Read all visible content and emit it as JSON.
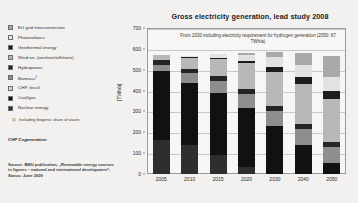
{
  "legend": {
    "items": [
      {
        "label": "EU grid interconnection",
        "color": "#a9a9a9"
      },
      {
        "label": "Photovoltaics",
        "color": "#e2e2e0"
      },
      {
        "label": "Geothermal energy",
        "color": "#1c1c1c"
      },
      {
        "label": "Wind en. (onshore/offshore)",
        "color": "#b8b8b8"
      },
      {
        "label": "Hydropower",
        "color": "#252525"
      },
      {
        "label": "Biomass",
        "sup": "1",
        "color": "#8e8e8e"
      },
      {
        "label": "CHP, fossil",
        "color": "#d2d2d0"
      },
      {
        "label": "Coal/gas",
        "color": "#111111"
      },
      {
        "label": "Nuclear energy",
        "color": "#2e2e2e"
      }
    ]
  },
  "footnote": {
    "mark": "1)",
    "text": "Including biogenic share of waste"
  },
  "chp_note": "CHP Cogeneration",
  "source": "Source: BMU publication, „Renewable energy sources in figures – national and international development“, Status: June 2009",
  "chart_data": {
    "type": "bar",
    "title": "Gross electricity generation, lead study 2008",
    "annotation": "From 2030 including electricity requirement for hydrogen generation (2050: 67 TWh/a)",
    "xlabel": "",
    "ylabel": "[TWh/a]",
    "ylim": [
      0,
      700
    ],
    "yticks": [
      0,
      100,
      200,
      300,
      400,
      500,
      600,
      700
    ],
    "grid": true,
    "legend_position": "left-external",
    "categories": [
      "2005",
      "2010",
      "2015",
      "2020",
      "2030",
      "2040",
      "2050"
    ],
    "series": [
      {
        "name": "Nuclear energy",
        "color": "#2e2e2e",
        "values": [
          163,
          140,
          92,
          33,
          0,
          0,
          0
        ]
      },
      {
        "name": "Coal/gas",
        "color": "#111111",
        "values": [
          330,
          298,
          295,
          283,
          230,
          140,
          52
        ]
      },
      {
        "name": "CHP, fossil",
        "color": "#d2d2d0",
        "values": [
          0,
          0,
          0,
          0,
          0,
          0,
          0
        ]
      },
      {
        "name": "Biomass",
        "color": "#8e8e8e",
        "values": [
          30,
          45,
          57,
          66,
          72,
          75,
          76
        ]
      },
      {
        "name": "Hydropower",
        "color": "#252525",
        "values": [
          22,
          23,
          24,
          25,
          25,
          25,
          25
        ]
      },
      {
        "name": "Wind en. (onshore/offshore)",
        "color": "#b8b8b8",
        "values": [
          27,
          52,
          85,
          124,
          164,
          191,
          205
        ]
      },
      {
        "name": "Geothermal energy",
        "color": "#1c1c1c",
        "values": [
          0,
          1,
          3,
          9,
          21,
          33,
          42
        ]
      },
      {
        "name": "Photovoltaics",
        "color": "#e2e2e0",
        "values": [
          1,
          9,
          20,
          32,
          47,
          58,
          66
        ]
      },
      {
        "name": "EU grid interconnection",
        "color": "#a9a9a9",
        "values": [
          0,
          0,
          0,
          6,
          28,
          60,
          98
        ]
      }
    ],
    "totals": [
      573,
      568,
      576,
      578,
      587,
      582,
      564
    ]
  }
}
